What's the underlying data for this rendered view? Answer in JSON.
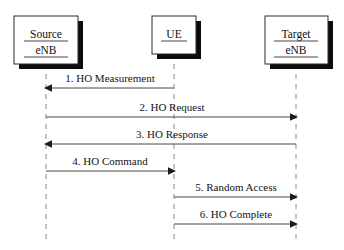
{
  "diagram": {
    "type": "sequence-diagram",
    "width": 344,
    "height": 250,
    "background_color": "#ffffff",
    "line_color": "#4a4a4a",
    "lifeline_color": "#8a8a8a",
    "text_color": "#131313",
    "actors": [
      {
        "id": "source",
        "label_line1": "Source",
        "label_line2": "eNB",
        "underlined": true,
        "x": 46,
        "box": {
          "x": 14,
          "y": 16,
          "width": 64,
          "height": 48
        },
        "lifeline": {
          "from_y": 64,
          "to_y": 242
        }
      },
      {
        "id": "ue",
        "label_line1": "UE",
        "label_line2": "",
        "underlined": true,
        "x": 174,
        "box": {
          "x": 152,
          "y": 16,
          "width": 44,
          "height": 38
        },
        "lifeline": {
          "from_y": 54,
          "to_y": 242
        }
      },
      {
        "id": "target",
        "label_line1": "Target",
        "label_line2": "eNB",
        "underlined": true,
        "x": 296,
        "box": {
          "x": 265,
          "y": 16,
          "width": 63,
          "height": 48
        },
        "lifeline": {
          "from_y": 64,
          "to_y": 242
        }
      }
    ],
    "messages": [
      {
        "number": "1.",
        "text": "1. HO Measurement",
        "from": "ue",
        "to": "source",
        "direction": "left",
        "y": 88,
        "label_y": 82,
        "label_x": 110
      },
      {
        "number": "2.",
        "text": "2. HO Request",
        "from": "source",
        "to": "target",
        "direction": "right",
        "y": 117,
        "label_y": 111,
        "label_x": 172
      },
      {
        "number": "3.",
        "text": "3. HO Response",
        "from": "target",
        "to": "source",
        "direction": "left",
        "y": 144,
        "label_y": 138,
        "label_x": 172
      },
      {
        "number": "4.",
        "text": "4. HO Command",
        "from": "source",
        "to": "ue",
        "direction": "right",
        "y": 171,
        "label_y": 165,
        "label_x": 110
      },
      {
        "number": "5.",
        "text": "5. Random Access",
        "from": "ue",
        "to": "target",
        "direction": "right",
        "y": 197,
        "label_y": 191,
        "label_x": 236
      },
      {
        "number": "6.",
        "text": "6. HO Complete",
        "from": "ue",
        "to": "target",
        "direction": "right",
        "y": 224,
        "label_y": 218,
        "label_x": 236
      }
    ]
  }
}
